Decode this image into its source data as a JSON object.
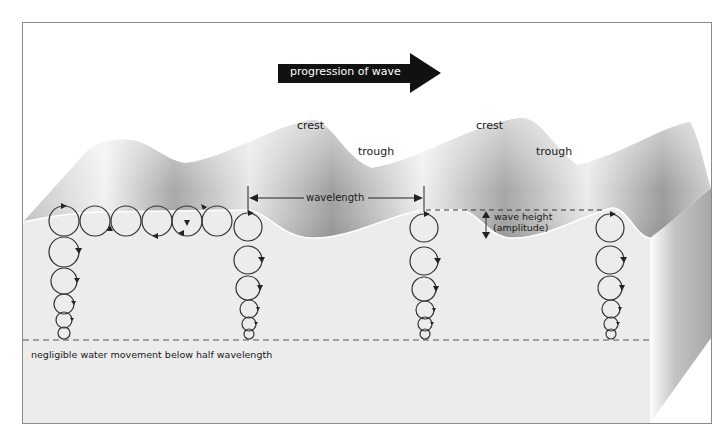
{
  "diagram": {
    "title_arrow": {
      "label": "progression of wave",
      "direction": "right",
      "color": "#111111"
    },
    "labels": {
      "crest_1": "crest",
      "trough_1": "trough",
      "crest_2": "crest",
      "trough_2": "trough",
      "wavelength": "wavelength",
      "wave_height_line1": "wave height",
      "wave_height_line2": "(amplitude)",
      "depth_note": "negligible water movement below half wavelength"
    },
    "orbit_columns": [
      {
        "x": 64,
        "circles": [
          {
            "cy": 221,
            "r": 15
          },
          {
            "cy": 252,
            "r": 15
          },
          {
            "cy": 281,
            "r": 13
          },
          {
            "cy": 304,
            "r": 10
          },
          {
            "cy": 320,
            "r": 8
          },
          {
            "cy": 333,
            "r": 6
          }
        ]
      },
      {
        "x": 248,
        "circles": [
          {
            "cy": 227,
            "r": 14
          },
          {
            "cy": 260,
            "r": 14
          },
          {
            "cy": 288,
            "r": 12
          },
          {
            "cy": 309,
            "r": 9
          },
          {
            "cy": 324,
            "r": 7
          },
          {
            "cy": 334,
            "r": 5
          }
        ]
      },
      {
        "x": 424,
        "circles": [
          {
            "cy": 228,
            "r": 14
          },
          {
            "cy": 261,
            "r": 14
          },
          {
            "cy": 289,
            "r": 12
          },
          {
            "cy": 310,
            "r": 9
          },
          {
            "cy": 324,
            "r": 7
          },
          {
            "cy": 334,
            "r": 5
          }
        ]
      },
      {
        "x": 610,
        "circles": [
          {
            "cy": 228,
            "r": 14
          },
          {
            "cy": 260,
            "r": 14
          },
          {
            "cy": 288,
            "r": 12
          },
          {
            "cy": 309,
            "r": 9
          },
          {
            "cy": 324,
            "r": 7
          },
          {
            "cy": 334,
            "r": 5
          }
        ]
      }
    ],
    "surface_orbits": [
      {
        "cx": 95,
        "cy": 221,
        "r": 15
      },
      {
        "cx": 126,
        "cy": 221,
        "r": 15
      },
      {
        "cx": 157,
        "cy": 221,
        "r": 15
      },
      {
        "cx": 187,
        "cy": 221,
        "r": 15
      },
      {
        "cx": 217,
        "cy": 221,
        "r": 15
      }
    ],
    "colors": {
      "frame": "#8a8a8a",
      "water_face": "#ececec",
      "surface_light": "#f8f8f8",
      "surface_dark": "#9a9a9a",
      "line": "#333333"
    }
  }
}
